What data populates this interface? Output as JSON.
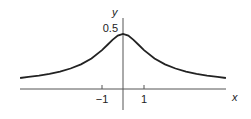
{
  "chart_data": {
    "type": "line",
    "title": "",
    "xlabel": "x",
    "ylabel": "y",
    "xlim": [
      -5,
      4.9
    ],
    "ylim": [
      0,
      0.5
    ],
    "x_ticks": [
      {
        "value": -1,
        "label": "−1"
      },
      {
        "value": 1,
        "label": "1"
      }
    ],
    "y_ticks": [
      {
        "value": 0.5,
        "label": "0.5"
      }
    ],
    "series": [
      {
        "name": "curve",
        "color": "#222222",
        "x": [
          -4.9,
          -4.5,
          -4,
          -3.5,
          -3,
          -2.5,
          -2,
          -1.5,
          -1,
          -0.75,
          -0.5,
          -0.25,
          0,
          0.25,
          0.5,
          0.75,
          1,
          1.5,
          2,
          2.5,
          3,
          3.5,
          4,
          4.5,
          4.9
        ],
        "y": [
          0.1,
          0.11,
          0.121,
          0.137,
          0.158,
          0.186,
          0.224,
          0.277,
          0.354,
          0.4,
          0.447,
          0.485,
          0.5,
          0.485,
          0.447,
          0.4,
          0.354,
          0.277,
          0.224,
          0.186,
          0.158,
          0.137,
          0.121,
          0.11,
          0.1
        ]
      }
    ],
    "grid": false,
    "legend": "none"
  }
}
